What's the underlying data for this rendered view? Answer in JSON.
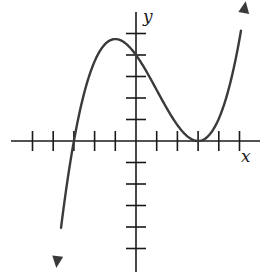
{
  "chart_data": {
    "type": "line",
    "title": "",
    "xlabel": "x",
    "ylabel": "y",
    "xlim": [
      -5,
      6
    ],
    "ylim": [
      -5,
      5
    ],
    "x_ticks": [
      -5,
      -4,
      -3,
      -2,
      -1,
      1,
      2,
      3,
      4,
      5
    ],
    "y_ticks": [
      -5,
      -4,
      -3,
      -2,
      -1,
      1,
      2,
      3,
      4,
      5
    ],
    "tick_labels_shown": false,
    "grid": false,
    "legend": null,
    "series": [
      {
        "name": "f(x)",
        "description": "cubic with root at x=-3 and double root (tangent) at x=3; y-intercept 4; local max near x=-1, y≈4.7; arrows at both ends",
        "formula_coeff": 0.148148,
        "roots": [
          -3,
          3,
          3
        ],
        "x": [
          -3.85,
          -3.5,
          -3,
          -2.5,
          -2,
          -1.5,
          -1,
          -0.5,
          0,
          0.5,
          1,
          1.5,
          2,
          2.5,
          3,
          3.5,
          4,
          4.5,
          5,
          5.3
        ],
        "values": [
          -6.0,
          -3.1,
          0,
          2.24,
          3.7,
          4.5,
          4.74,
          4.54,
          4.0,
          3.24,
          2.37,
          1.5,
          0.74,
          0.2,
          0,
          0.19,
          1.04,
          2.5,
          5.33,
          6.05
        ]
      }
    ],
    "annotations": {
      "x_axis_label": "x",
      "y_axis_label": "y"
    }
  },
  "layout": {
    "origin_px": [
      136,
      141
    ],
    "unit_px_x": 20.7,
    "unit_px_y": 21.5,
    "x_axis_extent_px": [
      11,
      260
    ],
    "y_axis_extent_px": [
      12,
      272
    ]
  },
  "labels": {
    "x": "x",
    "y": "y"
  }
}
